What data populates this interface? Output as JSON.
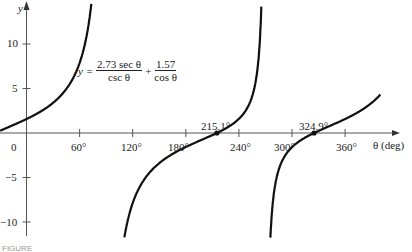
{
  "chart_data": {
    "type": "line",
    "title": "",
    "equation": {
      "lhs": "y =",
      "term1_num": "2.73 sec θ",
      "term1_den": "csc θ",
      "op": "+",
      "term2_num": "1.57",
      "term2_den": "cos θ"
    },
    "function": "y = 2.73 tan(θ) + 1.57 sec(θ)",
    "xlabel": "θ (deg)",
    "ylabel": "y",
    "xlim": [
      -30,
      420
    ],
    "ylim": [
      -12,
      15
    ],
    "x_ticks": [
      0,
      60,
      120,
      180,
      240,
      300,
      360
    ],
    "x_tick_labels": [
      "0",
      "60°",
      "120°",
      "180°",
      "240°",
      "300°",
      "360°"
    ],
    "y_ticks": [
      -10,
      -5,
      5,
      10
    ],
    "y_tick_labels": [
      "−10",
      "−5",
      "5",
      "10"
    ],
    "asymptotes": [
      90,
      270
    ],
    "roots": [
      {
        "x": 215.1,
        "label": "215.1°"
      },
      {
        "x": 324.9,
        "label": "324.9°"
      }
    ],
    "grid": false,
    "legend": null
  },
  "caption": "FIGURE"
}
